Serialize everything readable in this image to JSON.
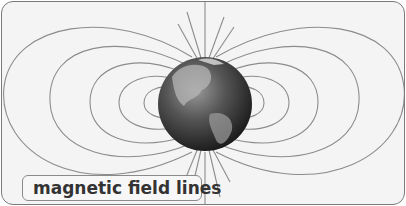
{
  "diagram": {
    "label": "magnetic field lines",
    "colors": {
      "background": "#f4f4f4",
      "border": "#7a7a7a",
      "field_line": "#8c8c8c",
      "label_text": "#333333"
    }
  }
}
